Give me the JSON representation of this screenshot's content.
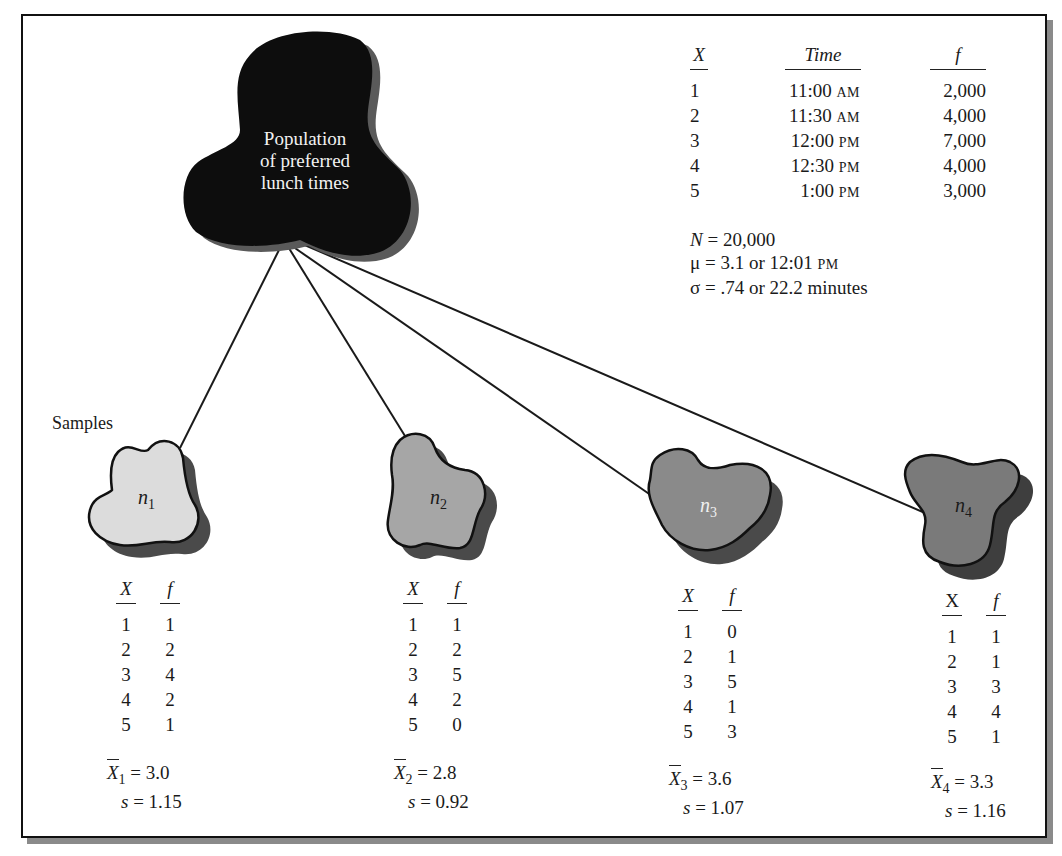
{
  "population": {
    "label_lines": [
      "Population",
      "of preferred",
      "lunch times"
    ],
    "table": {
      "headers": {
        "x": "X",
        "time": "Time",
        "f": "f"
      },
      "rows": [
        {
          "x": "1",
          "time": "11:00",
          "period": "AM",
          "f": "2,000"
        },
        {
          "x": "2",
          "time": "11:30",
          "period": "AM",
          "f": "4,000"
        },
        {
          "x": "3",
          "time": "12:00",
          "period": "PM",
          "f": "7,000"
        },
        {
          "x": "4",
          "time": "12:30",
          "period": "PM",
          "f": "4,000"
        },
        {
          "x": "5",
          "time": "1:00",
          "period": "PM",
          "f": "3,000"
        }
      ]
    },
    "stats": {
      "N": "N = 20,000",
      "mu_prefix": "μ  = 3.1 or 12:01 ",
      "mu_suffix": "PM",
      "sigma": "σ  = .74 or 22.2 minutes"
    },
    "color": "#0d0d0d"
  },
  "samples_label": "Samples",
  "samples": [
    {
      "name": "n",
      "sub": "1",
      "fill": "#dcdcdc",
      "headers": {
        "x": "X",
        "f": "f"
      },
      "rows": [
        [
          "1",
          "1"
        ],
        [
          "2",
          "2"
        ],
        [
          "3",
          "4"
        ],
        [
          "4",
          "2"
        ],
        [
          "5",
          "1"
        ]
      ],
      "mean_label": "X",
      "mean_sub": "1",
      "mean_value": " = 3.0",
      "sd_label": "s",
      "sd_value": " = 1.15"
    },
    {
      "name": "n",
      "sub": "2",
      "fill": "#a6a6a6",
      "headers": {
        "x": "X",
        "f": "f"
      },
      "rows": [
        [
          "1",
          "1"
        ],
        [
          "2",
          "2"
        ],
        [
          "3",
          "5"
        ],
        [
          "4",
          "2"
        ],
        [
          "5",
          "0"
        ]
      ],
      "mean_label": "X",
      "mean_sub": "2",
      "mean_value": " = 2.8",
      "sd_label": "s",
      "sd_value": " = 0.92"
    },
    {
      "name": "n",
      "sub": "3",
      "fill": "#8a8a8a",
      "headers": {
        "x": "X",
        "f": "f"
      },
      "rows": [
        [
          "1",
          "0"
        ],
        [
          "2",
          "1"
        ],
        [
          "3",
          "5"
        ],
        [
          "4",
          "1"
        ],
        [
          "5",
          "3"
        ]
      ],
      "mean_label": "X",
      "mean_sub": "3",
      "mean_value": " = 3.6",
      "sd_label": "s",
      "sd_value": " = 1.07"
    },
    {
      "name": "n",
      "sub": "4",
      "fill": "#7a7a7a",
      "headers": {
        "x": "X",
        "f": "f"
      },
      "rows": [
        [
          "1",
          "1"
        ],
        [
          "2",
          "1"
        ],
        [
          "3",
          "3"
        ],
        [
          "4",
          "4"
        ],
        [
          "5",
          "1"
        ]
      ],
      "mean_label": "X",
      "mean_sub": "4",
      "mean_value": " = 3.3",
      "sd_label": "s",
      "sd_value": " = 1.16"
    }
  ]
}
